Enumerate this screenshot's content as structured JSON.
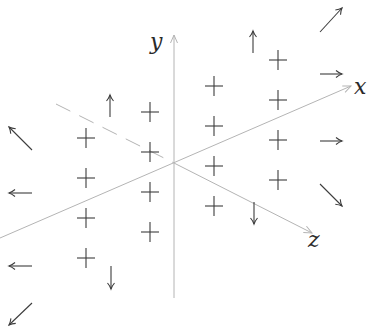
{
  "diagram": {
    "axes": {
      "x": {
        "label": "x",
        "from": [
          0,
          238
        ],
        "to": [
          351,
          86
        ],
        "label_pos": [
          354,
          94
        ]
      },
      "y": {
        "label": "y",
        "from": [
          174,
          298
        ],
        "to": [
          174,
          35
        ],
        "label_pos": [
          150,
          49
        ]
      },
      "z": {
        "label": "z",
        "dashed_from": [
          56,
          104
        ],
        "from": [
          174,
          163
        ],
        "to": [
          312,
          233
        ],
        "label_pos": [
          308,
          247
        ]
      }
    },
    "origin": [
      174,
      163
    ],
    "colors": {
      "axis": "#b4b4b4",
      "glyph": "#3c3c3c",
      "label": "#2a2a2a"
    },
    "plus_signs": [
      {
        "x": 86,
        "y": 138
      },
      {
        "x": 86,
        "y": 178
      },
      {
        "x": 86,
        "y": 218
      },
      {
        "x": 86,
        "y": 258
      },
      {
        "x": 150,
        "y": 112
      },
      {
        "x": 150,
        "y": 152
      },
      {
        "x": 150,
        "y": 192
      },
      {
        "x": 150,
        "y": 232
      },
      {
        "x": 214,
        "y": 86
      },
      {
        "x": 214,
        "y": 126
      },
      {
        "x": 214,
        "y": 166
      },
      {
        "x": 214,
        "y": 206
      },
      {
        "x": 278,
        "y": 60
      },
      {
        "x": 278,
        "y": 100
      },
      {
        "x": 278,
        "y": 140
      },
      {
        "x": 278,
        "y": 180
      }
    ],
    "arrows": [
      {
        "name": "up-arrow-left",
        "from": [
          110,
          117
        ],
        "to": [
          110,
          95
        ]
      },
      {
        "name": "up-arrow-right",
        "from": [
          253,
          53
        ],
        "to": [
          253,
          31
        ]
      },
      {
        "name": "down-arrow-left",
        "from": [
          111,
          266
        ],
        "to": [
          111,
          289
        ]
      },
      {
        "name": "down-arrow-right",
        "from": [
          254,
          202
        ],
        "to": [
          254,
          224
        ]
      },
      {
        "name": "northeast-arrow",
        "from": [
          320,
          32
        ],
        "to": [
          342,
          8
        ]
      },
      {
        "name": "east-arrow-top",
        "from": [
          320,
          74
        ],
        "to": [
          342,
          74
        ]
      },
      {
        "name": "east-arrow-bottom",
        "from": [
          320,
          141
        ],
        "to": [
          342,
          141
        ]
      },
      {
        "name": "southeast-arrow",
        "from": [
          320,
          184
        ],
        "to": [
          342,
          206
        ]
      },
      {
        "name": "northwest-arrow",
        "from": [
          32,
          150
        ],
        "to": [
          9,
          127
        ]
      },
      {
        "name": "west-arrow-top",
        "from": [
          32,
          193
        ],
        "to": [
          9,
          193
        ]
      },
      {
        "name": "west-arrow-bottom",
        "from": [
          32,
          266
        ],
        "to": [
          9,
          266
        ]
      },
      {
        "name": "southwest-arrow",
        "from": [
          32,
          303
        ],
        "to": [
          9,
          325
        ]
      }
    ]
  }
}
